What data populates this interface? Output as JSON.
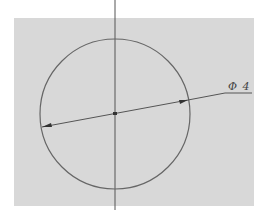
{
  "drawing": {
    "dimension_label": "Φ 4",
    "circle": {
      "cx": 115,
      "cy": 114,
      "r": 75
    },
    "colors": {
      "background": "#d8d8d8",
      "line": "#555555",
      "page": "#ffffff"
    }
  }
}
